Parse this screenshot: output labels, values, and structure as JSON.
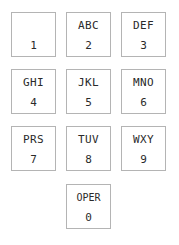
{
  "diagram": {
    "background_color": "#ffffff",
    "key_border_color": "#b4b4b4",
    "key_fill_color": "#ffffff",
    "text_color": "#2a2a2a",
    "rows": 4,
    "columns": 3
  },
  "keys": [
    {
      "digit": "1",
      "letters": "",
      "row": 0,
      "col": 0
    },
    {
      "digit": "2",
      "letters": "ABC",
      "row": 0,
      "col": 1
    },
    {
      "digit": "3",
      "letters": "DEF",
      "row": 0,
      "col": 2
    },
    {
      "digit": "4",
      "letters": "GHI",
      "row": 1,
      "col": 0
    },
    {
      "digit": "5",
      "letters": "JKL",
      "row": 1,
      "col": 1
    },
    {
      "digit": "6",
      "letters": "MNO",
      "row": 1,
      "col": 2
    },
    {
      "digit": "7",
      "letters": "PRS",
      "row": 2,
      "col": 0
    },
    {
      "digit": "8",
      "letters": "TUV",
      "row": 2,
      "col": 1
    },
    {
      "digit": "9",
      "letters": "WXY",
      "row": 2,
      "col": 2
    },
    {
      "digit": "0",
      "letters": "OPER",
      "row": 3,
      "col": 1
    }
  ]
}
